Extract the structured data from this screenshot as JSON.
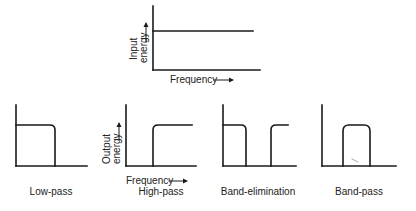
{
  "figure": {
    "input_panel": {
      "ylabel_line1": "Input",
      "ylabel_line2": "energy",
      "xlabel": "Frequency",
      "response": "flat"
    },
    "output_panels": [
      {
        "id": "low-pass",
        "caption": "Low-pass",
        "response": "passes low frequencies, cuts off above cutoff"
      },
      {
        "id": "high-pass",
        "caption": "High-pass",
        "response": "blocks low frequencies, passes above cutoff",
        "ylabel_line1": "Output",
        "ylabel_line2": "energy",
        "xlabel": "Frequency"
      },
      {
        "id": "band-elimination",
        "caption": "Band-elimination",
        "response": "passes low and high, blocks a middle band"
      },
      {
        "id": "band-pass",
        "caption": "Band-pass",
        "response": "passes only a middle band"
      }
    ],
    "arrow_glyph": "→",
    "line_color": "#1a1a1a"
  }
}
